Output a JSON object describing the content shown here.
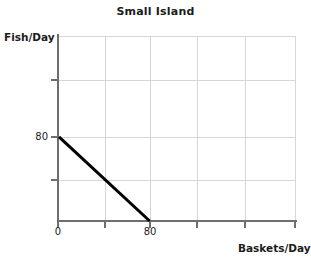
{
  "chart_data": {
    "type": "line",
    "title": "Small Island",
    "xlabel": "Baskets/Day",
    "ylabel": "Fish/Day",
    "x": [
      0,
      80
    ],
    "values": [
      80,
      0
    ],
    "series": [
      {
        "name": "Production Possibilities Frontier",
        "x": [
          0,
          80
        ],
        "values": [
          80,
          0
        ],
        "color": "#000000"
      }
    ],
    "xlim": [
      0,
      210
    ],
    "ylim": [
      0,
      176
    ],
    "xticks": [
      0,
      80
    ],
    "xtick_labels": [
      "0",
      "80"
    ],
    "yticks": [
      80
    ],
    "ytick_labels": [
      "80"
    ],
    "grid": true,
    "grid_color": "#d6d6d6",
    "legend": "none",
    "axis_color": "#6e6e6e",
    "text_color": "#1b1b1b",
    "background": "#ffffff"
  },
  "labels": {
    "title": "Small Island",
    "y_axis_title": "Fish/Day",
    "x_axis_title": "Baskets/Day",
    "y_tick_80": "80",
    "x_tick_0": "0",
    "x_tick_80": "80"
  }
}
